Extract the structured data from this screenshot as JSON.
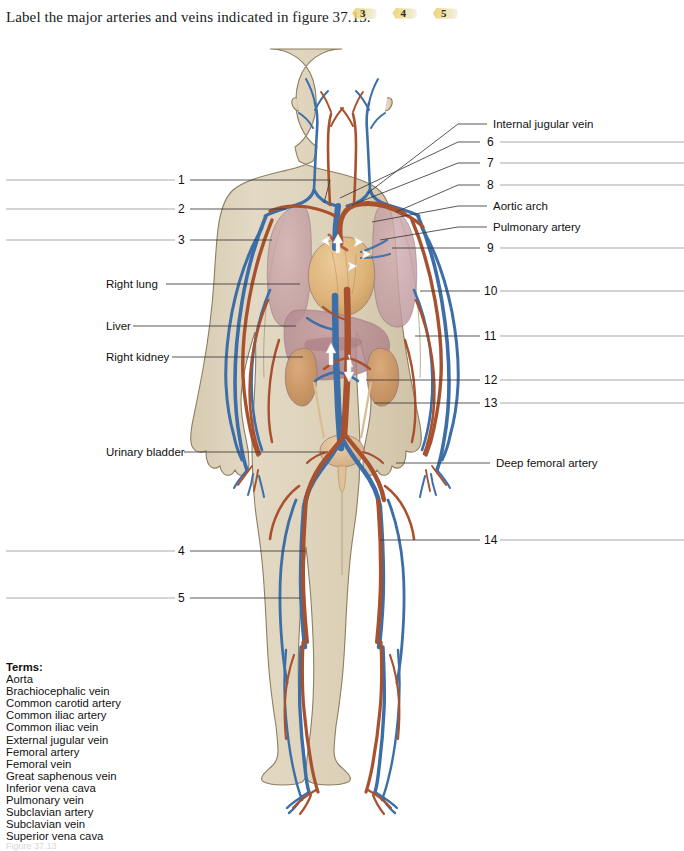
{
  "header": {
    "question": "Label the major arteries and veins indicated in figure 37.13.",
    "badges": [
      "3",
      "4",
      "5"
    ]
  },
  "figure": {
    "alt": "anterior view of human body showing systemic arteries in red and veins in blue",
    "colors": {
      "skin": "#ded3bb",
      "skin_outline": "#8a7a5c",
      "artery": "#a8512f",
      "vein": "#3c6ea8",
      "heart": "#ddb378",
      "lung": "#c9a5a9",
      "liver": "#b98d93",
      "kidney": "#cc9a6a",
      "bladder": "#e0bc92",
      "leader_line": "#3a3a3a"
    }
  },
  "callouts_left": [
    {
      "id": "1",
      "text": "1",
      "kind": "number"
    },
    {
      "id": "2",
      "text": "2",
      "kind": "number"
    },
    {
      "id": "3",
      "text": "3",
      "kind": "number"
    },
    {
      "id": "right-lung",
      "text": "Right lung",
      "kind": "term"
    },
    {
      "id": "liver",
      "text": "Liver",
      "kind": "term"
    },
    {
      "id": "right-kidney",
      "text": "Right kidney",
      "kind": "term"
    },
    {
      "id": "urinary-bladder",
      "text": "Urinary bladder",
      "kind": "term"
    },
    {
      "id": "4",
      "text": "4",
      "kind": "number"
    },
    {
      "id": "5",
      "text": "5",
      "kind": "number"
    }
  ],
  "callouts_right": [
    {
      "id": "internal-jugular-vein",
      "text": "Internal jugular vein",
      "kind": "term"
    },
    {
      "id": "6",
      "text": "6",
      "kind": "number"
    },
    {
      "id": "7",
      "text": "7",
      "kind": "number"
    },
    {
      "id": "8",
      "text": "8",
      "kind": "number"
    },
    {
      "id": "aortic-arch",
      "text": "Aortic arch",
      "kind": "term"
    },
    {
      "id": "pulmonary-artery",
      "text": "Pulmonary artery",
      "kind": "term"
    },
    {
      "id": "9",
      "text": "9",
      "kind": "number"
    },
    {
      "id": "10",
      "text": "10",
      "kind": "number"
    },
    {
      "id": "11",
      "text": "11",
      "kind": "number"
    },
    {
      "id": "12",
      "text": "12",
      "kind": "number"
    },
    {
      "id": "13",
      "text": "13",
      "kind": "number"
    },
    {
      "id": "deep-femoral-artery",
      "text": "Deep femoral artery",
      "kind": "term"
    },
    {
      "id": "14",
      "text": "14",
      "kind": "number"
    }
  ],
  "terms": {
    "heading": "Terms:",
    "items": [
      "Aorta",
      "Brachiocephalic vein",
      "Common carotid artery",
      "Common iliac artery",
      "Common iliac vein",
      "External jugular vein",
      "Femoral artery",
      "Femoral vein",
      "Great saphenous vein",
      "Inferior vena cava",
      "Pulmonary vein",
      "Subclavian artery",
      "Subclavian vein",
      "Superior vena cava"
    ]
  },
  "caption": "Figure 37.13"
}
